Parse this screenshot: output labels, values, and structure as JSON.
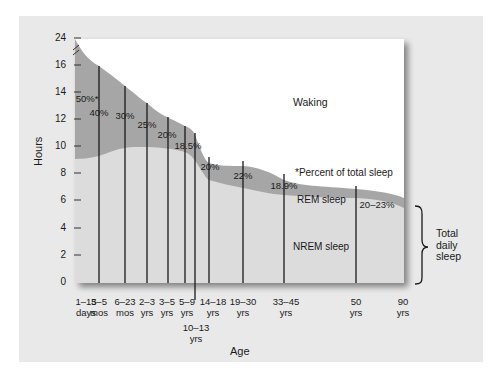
{
  "chart_data": {
    "type": "area",
    "title": "",
    "xlabel": "Age",
    "ylabel": "Hours",
    "y_ticks": [
      "0",
      "2",
      "4",
      "6",
      "8",
      "10",
      "12",
      "14",
      "16",
      "24"
    ],
    "ylim": [
      0,
      24
    ],
    "axis_break": "between 16 and 24",
    "categories": [
      "1–15 days",
      "3–5 mos",
      "6–23 mos",
      "2–3 yrs",
      "3–5 yrs",
      "5–9 yrs",
      "10–13 yrs",
      "14–18 yrs",
      "19–30 yrs",
      "33–45 yrs",
      "50 yrs",
      "90 yrs"
    ],
    "series": [
      {
        "name": "Total sleep (hrs)",
        "values": [
          16.5,
          15.8,
          14.3,
          13.1,
          12.2,
          11.5,
          10.8,
          9.2,
          8.6,
          7.5,
          7.0,
          6.0
        ]
      },
      {
        "name": "NREM sleep (hrs)",
        "values": [
          9.0,
          9.5,
          10.0,
          9.8,
          9.8,
          9.4,
          8.7,
          7.5,
          6.7,
          6.4,
          6.2,
          5.0
        ]
      },
      {
        "name": "REM % of total sleep",
        "values": [
          "50%*",
          "40%",
          "30%",
          "25%",
          "20%",
          "18.5%",
          "",
          "20%",
          "22%",
          "18.9%",
          "20–23%",
          ""
        ]
      }
    ],
    "annotations": [
      "Waking",
      "*Percent of total sleep",
      "REM sleep",
      "NREM sleep",
      "Total daily sleep"
    ],
    "grid": false,
    "legend": "none"
  },
  "labels": {
    "y_axis_title": "Hours",
    "x_axis_title": "Age",
    "waking": "Waking",
    "footnote": "*Percent of total sleep",
    "rem": "REM sleep",
    "nrem": "NREM sleep",
    "total_line1": "Total",
    "total_line2": "daily",
    "total_line3": "sleep"
  },
  "y_ticks": [
    {
      "label": "24",
      "y": 38
    },
    {
      "label": "16",
      "y": 65
    },
    {
      "label": "14",
      "y": 92
    },
    {
      "label": "12",
      "y": 119
    },
    {
      "label": "10",
      "y": 146
    },
    {
      "label": "8",
      "y": 173
    },
    {
      "label": "6",
      "y": 200
    },
    {
      "label": "4",
      "y": 228
    },
    {
      "label": "2",
      "y": 255
    },
    {
      "label": "0",
      "y": 282
    }
  ],
  "x_labels": [
    {
      "l1": "1–15",
      "l2": "days",
      "x": 86
    },
    {
      "l1": "3–5",
      "l2": "mos",
      "x": 99
    },
    {
      "l1": "6–23",
      "l2": "mos",
      "x": 125
    },
    {
      "l1": "2–3",
      "l2": "yrs",
      "x": 147
    },
    {
      "l1": "3–5",
      "l2": "yrs",
      "x": 167
    },
    {
      "l1": "5–9",
      "l2": "yrs",
      "x": 187
    },
    {
      "l1": "14–18",
      "l2": "yrs",
      "x": 213
    },
    {
      "l1": "19–30",
      "l2": "yrs",
      "x": 243
    },
    {
      "l1": "33–45",
      "l2": "yrs",
      "x": 286
    },
    {
      "l1": "50",
      "l2": "yrs",
      "x": 356
    },
    {
      "l1": "90",
      "l2": "yrs",
      "x": 403
    }
  ],
  "x_label_below": {
    "l1": "10–13",
    "l2": "yrs",
    "x": 196
  },
  "percents": [
    {
      "text": "50%*",
      "x": 87,
      "y": 93
    },
    {
      "text": "40%",
      "x": 99,
      "y": 107
    },
    {
      "text": "30%",
      "x": 125,
      "y": 110
    },
    {
      "text": "25%",
      "x": 147,
      "y": 119
    },
    {
      "text": "20%",
      "x": 167,
      "y": 129
    },
    {
      "text": "18.5%",
      "x": 188,
      "y": 140
    },
    {
      "text": "20%",
      "x": 210,
      "y": 161
    },
    {
      "text": "22%",
      "x": 243,
      "y": 170
    },
    {
      "text": "18.9%",
      "x": 284,
      "y": 180
    },
    {
      "text": "20–23%",
      "x": 377,
      "y": 199
    }
  ]
}
